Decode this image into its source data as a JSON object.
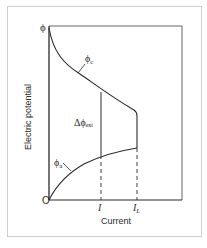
{
  "figure": {
    "y_axis_label": "Electric potential",
    "x_axis_label": "Current",
    "y_top_label": "ϕ",
    "origin_label": "O",
    "curves": {
      "cathode": {
        "symbol": "ϕ",
        "subscript": "c"
      },
      "anode": {
        "symbol": "ϕ",
        "subscript": "a"
      }
    },
    "delta_label": {
      "prefix": "Δϕ",
      "subscript": "ext"
    },
    "x_ticks": [
      {
        "main": "I",
        "sub": ""
      },
      {
        "main": "I",
        "sub": "L"
      }
    ]
  },
  "colors": {
    "line": "#2a2a2a",
    "frame": "#c8c8c8",
    "background": "#ffffff"
  }
}
